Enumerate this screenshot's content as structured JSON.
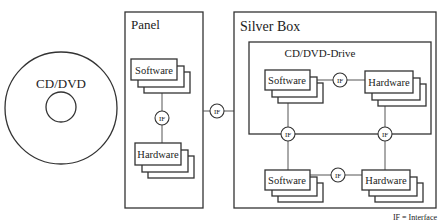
{
  "disc": {
    "label": "CD/DVD"
  },
  "panel": {
    "title": "Panel",
    "software_label": "Software",
    "hardware_label": "Hardware",
    "interface_label": "IF"
  },
  "link": {
    "interface_label": "IF"
  },
  "silver_box": {
    "title": "Silver Box",
    "drive": {
      "title": "CD/DVD-Drive",
      "software_label": "Software",
      "hardware_label": "Hardware",
      "interface_label": "IF"
    },
    "left_interface_label": "IF",
    "right_interface_label": "IF",
    "software_label": "Software",
    "hardware_label": "Hardware",
    "interface_label": "IF"
  },
  "legend": {
    "text": "IF = Interface"
  },
  "colors": {
    "stroke": "#333333",
    "background": "#ffffff"
  }
}
